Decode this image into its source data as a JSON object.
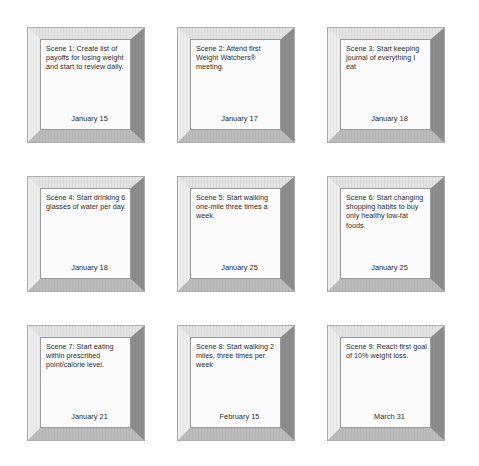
{
  "page": {
    "background_color": "#ffffff",
    "text_color": "#2b2b2b",
    "frame_colors": {
      "bevel_top": "#e3e3e3",
      "bevel_right": "#8d8d8d",
      "bevel_bottom": "#bcbcbc",
      "bevel_left": "#eeeeee",
      "mat": "#fbfbfb",
      "frame_outline": "#b0b0b0"
    },
    "layout": {
      "columns": 3,
      "rows": 3,
      "total_frames": 9
    }
  },
  "frames": [
    {
      "index": 1,
      "label": "scene-1",
      "body": "Scene 1:  Create list of payoffs for losing weight and start to review daily.",
      "date": "January 15"
    },
    {
      "index": 2,
      "label": "scene-2",
      "body": "Scene 2:  Attend first Weight Watchers® meeting.",
      "date": "January 17"
    },
    {
      "index": 3,
      "label": "scene-3",
      "body": "Scene 3:  Start keeping journal of everything I eat",
      "date": "January 18"
    },
    {
      "index": 4,
      "label": "scene-4",
      "body": "Scene 4:  Start drinking 6 glasses of water per day.",
      "date": "January 18"
    },
    {
      "index": 5,
      "label": "scene-5",
      "body": "Scene 5:  Start walking one-mile three times a week.",
      "date": "January 25"
    },
    {
      "index": 6,
      "label": "scene-6",
      "body": "Scene 6: Start changing shopping habits to buy only healthy low-fat foods.",
      "date": "January 25"
    },
    {
      "index": 7,
      "label": "scene-7",
      "body": "Scene 7:  Start eating within prescribed point/calorie level.",
      "date": "January 21"
    },
    {
      "index": 8,
      "label": "scene-8",
      "body": "Scene 8:  Start walking 2 miles, three times per week",
      "date": "February 15"
    },
    {
      "index": 9,
      "label": "scene-9",
      "body": "Scene 9:  Reach first goal of 10% weight loss.",
      "date": "March 31"
    }
  ]
}
